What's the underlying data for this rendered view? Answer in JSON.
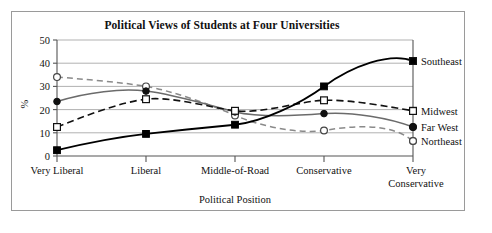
{
  "figure": {
    "title": "Political Views of Students at Four Universities",
    "frame_border_color": "#9a9a9a",
    "background": "#ffffff"
  },
  "axes": {
    "y_title": "%",
    "x_title": "Political Position",
    "y_ticks": [
      "0",
      "10",
      "20",
      "30",
      "40",
      "50"
    ],
    "x_categories": [
      "Very Liberal",
      "Liberal",
      "Middle-of-Road",
      "Conservative",
      "Very Conservative"
    ]
  },
  "legend": {
    "entries": [
      {
        "label": "Southeast",
        "marker": "filled-square",
        "line": "solid",
        "color": "#000000"
      },
      {
        "label": "Midwest",
        "marker": "open-square",
        "line": "dashed",
        "color": "#000000"
      },
      {
        "label": "Far West",
        "marker": "filled-circle",
        "line": "solid",
        "color": "#6b6b6b"
      },
      {
        "label": "Northeast",
        "marker": "open-circle",
        "line": "dashed",
        "color": "#8a8a8a"
      }
    ]
  },
  "chart_data": {
    "type": "line",
    "title": "Political Views of Students at Four Universities",
    "xlabel": "Political Position",
    "ylabel": "%",
    "categories": [
      "Very Liberal",
      "Liberal",
      "Middle-of-Road",
      "Conservative",
      "Very Conservative"
    ],
    "ylim": [
      0,
      50
    ],
    "yticks": [
      0,
      10,
      20,
      30,
      40,
      50
    ],
    "grid": "horizontal",
    "legend_position": "right-of-axes",
    "series": [
      {
        "name": "Southeast",
        "values": [
          2.5,
          9.5,
          13.5,
          30,
          41
        ],
        "marker": "filled-square",
        "line": "solid",
        "color": "#000000"
      },
      {
        "name": "Midwest",
        "values": [
          12.5,
          24.5,
          19.5,
          24,
          19.5
        ],
        "marker": "open-square",
        "line": "dashed",
        "color": "#000000"
      },
      {
        "name": "Far West",
        "values": [
          23.5,
          28,
          19,
          18,
          12.5
        ],
        "marker": "filled-circle",
        "line": "solid",
        "color": "#6b6b6b"
      },
      {
        "name": "Northeast",
        "values": [
          34,
          30,
          17.5,
          11,
          6.5
        ],
        "marker": "open-circle",
        "line": "dashed",
        "color": "#8a8a8a"
      }
    ]
  }
}
